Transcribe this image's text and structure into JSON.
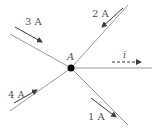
{
  "diagram": {
    "title": "",
    "node": {
      "label": "A",
      "x": 71,
      "y": 68
    },
    "branches": [
      {
        "id": "upper-left",
        "current_label": "3 A",
        "direction": "into-node"
      },
      {
        "id": "upper-right",
        "current_label": "2 A",
        "direction": "into-node"
      },
      {
        "id": "right",
        "current_label": "i",
        "direction": "out-of-node",
        "style": "dashed",
        "unknown": true
      },
      {
        "id": "lower-left",
        "current_label": "4 A",
        "direction": "into-node"
      },
      {
        "id": "lower-right",
        "current_label": "1 A",
        "direction": "out-of-node"
      }
    ]
  },
  "colors": {
    "wire": "#9a9a9a",
    "arrow": "#3a3a3a",
    "node": "#000000",
    "text": "#555555"
  }
}
